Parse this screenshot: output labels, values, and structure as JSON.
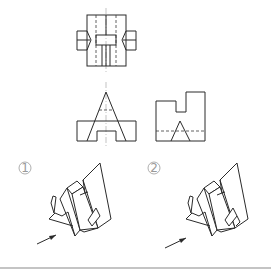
{
  "figure": {
    "type": "orthographic-to-isometric-selection",
    "views": {
      "top_view": {
        "label": "top-view"
      },
      "front_view": {
        "label": "front-view"
      },
      "side_view": {
        "label": "left-side-view"
      }
    },
    "options": [
      {
        "id": 1,
        "label": "①",
        "number": "1"
      },
      {
        "id": 2,
        "label": "②",
        "number": "2"
      }
    ],
    "colors": {
      "line": "#2a2a2a",
      "label": "#9a9a9a",
      "bottom_rule": "#b0b0b0"
    }
  }
}
